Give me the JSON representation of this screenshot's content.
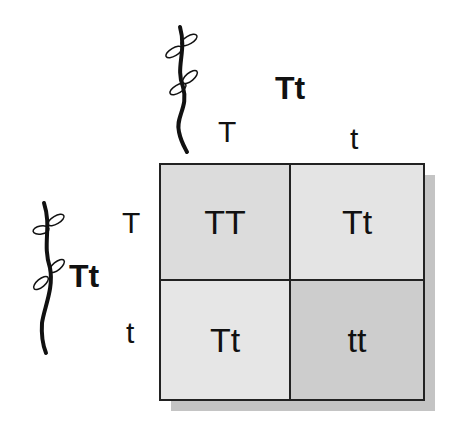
{
  "top_parent": {
    "genotype": "Tt",
    "alleles": [
      "T",
      "t"
    ]
  },
  "left_parent": {
    "genotype": "Tt",
    "alleles": [
      "T",
      "t"
    ]
  },
  "cells": [
    {
      "row": 0,
      "col": 0,
      "genotype": "TT",
      "color": "#dcdcdc"
    },
    {
      "row": 0,
      "col": 1,
      "genotype": "Tt",
      "color": "#e4e4e4"
    },
    {
      "row": 1,
      "col": 0,
      "genotype": "Tt",
      "color": "#e6e6e6"
    },
    {
      "row": 1,
      "col": 1,
      "genotype": "tt",
      "color": "#cdcdcd"
    }
  ],
  "icons": {
    "top_plant": "tall-plant-icon",
    "left_plant": "tall-plant-icon"
  }
}
